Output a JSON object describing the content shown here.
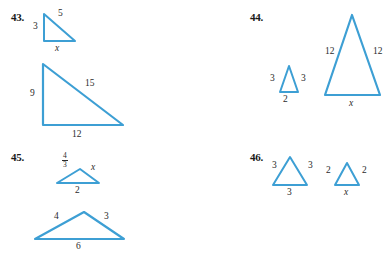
{
  "page": {
    "width": 391,
    "height": 260,
    "background": "#ffffff",
    "stroke_color": "#3d9fd4",
    "text_color": "#2b2b2b"
  },
  "problems": [
    {
      "number": "43.",
      "figures": [
        {
          "name": "small-right-triangle",
          "labels": {
            "left": "3",
            "hyp": "5",
            "bottom": "x"
          }
        },
        {
          "name": "large-right-triangle",
          "labels": {
            "left": "9",
            "hyp": "15",
            "bottom": "12"
          }
        }
      ]
    },
    {
      "number": "44.",
      "figures": [
        {
          "name": "small-isosceles-triangle",
          "labels": {
            "left": "3",
            "right": "3",
            "bottom": "2"
          }
        },
        {
          "name": "large-isosceles-triangle",
          "labels": {
            "left": "12",
            "right": "12",
            "bottom": "x"
          }
        }
      ]
    },
    {
      "number": "45.",
      "figures": [
        {
          "name": "small-scalene-triangle",
          "labels": {
            "left_numerator": "4",
            "left_denominator": "3",
            "right": "x",
            "bottom": "2"
          }
        },
        {
          "name": "large-scalene-triangle",
          "labels": {
            "left": "4",
            "right": "3",
            "bottom": "6"
          }
        }
      ]
    },
    {
      "number": "46.",
      "figures": [
        {
          "name": "equilateral-triangle-three",
          "labels": {
            "left": "3",
            "right": "3",
            "bottom": "3"
          }
        },
        {
          "name": "equilateral-triangle-two",
          "labels": {
            "left": "2",
            "right": "2",
            "bottom": "x"
          }
        }
      ]
    }
  ]
}
